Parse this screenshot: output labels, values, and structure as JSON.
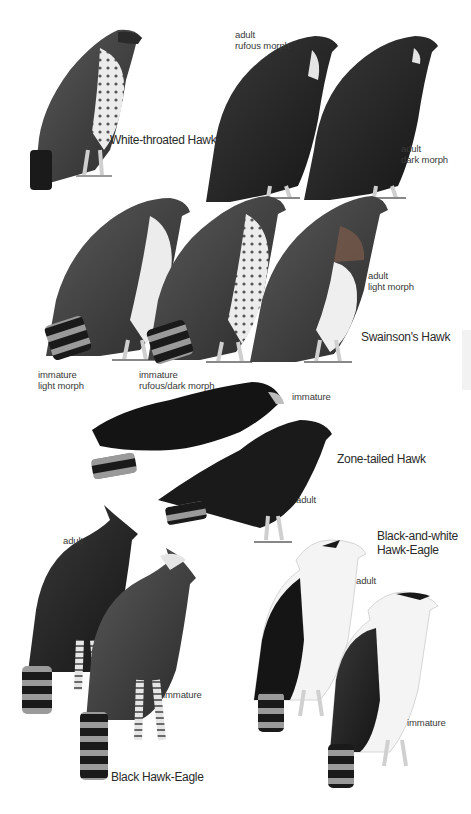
{
  "plate": {
    "colors": {
      "background": "#ffffff",
      "text": "#333333",
      "dark_plumage": "#1e1e1e",
      "mid_plumage": "#3c3c3c",
      "light_plumage": "#e8e8e8",
      "legs": "#cfcfcf"
    },
    "species": [
      {
        "name": "White-throated Hawk",
        "figures": [
          {
            "label": ""
          }
        ]
      },
      {
        "name": "Swainson's Hawk",
        "figures": [
          {
            "label_line1": "adult",
            "label_line2": "rufous morph"
          },
          {
            "label_line1": "adult",
            "label_line2": "dark morph"
          },
          {
            "label_line1": "immature",
            "label_line2": "light morph"
          },
          {
            "label_line1": "immature",
            "label_line2": "rufous/dark morph"
          },
          {
            "label_line1": "adult",
            "label_line2": "light morph"
          }
        ]
      },
      {
        "name": "Zone-tailed Hawk",
        "figures": [
          {
            "label": "immature"
          },
          {
            "label": "adult"
          }
        ]
      },
      {
        "name": "Black Hawk-Eagle",
        "figures": [
          {
            "label": "adult"
          },
          {
            "label": "immature"
          }
        ]
      },
      {
        "name_line1": "Black-and-white",
        "name_line2": "Hawk-Eagle",
        "figures": [
          {
            "label": "adult"
          },
          {
            "label": "immature"
          }
        ]
      }
    ]
  }
}
